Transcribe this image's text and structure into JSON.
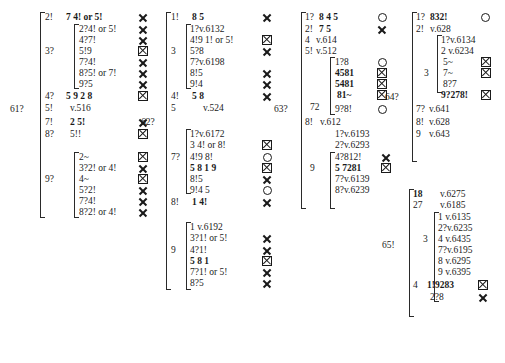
{
  "document": {
    "kind": "critical-apparatus-table",
    "page_width": 505,
    "page_height": 363,
    "background": "#ffffff",
    "ink": "#1a1a1a"
  },
  "symbols": {
    "cross": "X",
    "boxed_cross": "⌧",
    "circle": "O"
  },
  "columns": [
    {
      "id": "col1",
      "group_label": "61?",
      "entries": [
        {
          "key": "2!",
          "text": "7 4! or 5!",
          "sym": "cross"
        },
        {
          "key": "",
          "text": "2?4! or 5!",
          "sym": "cross",
          "sub": true
        },
        {
          "key": "",
          "text": "4?7!",
          "sym": "cross",
          "sub": true
        },
        {
          "key": "3?",
          "text": "5!9",
          "sym": "boxed_cross",
          "sub": true
        },
        {
          "key": "",
          "text": "7?4!",
          "sym": "cross",
          "sub": true
        },
        {
          "key": "",
          "text": "8?5! or 7!",
          "sym": "cross",
          "sub": true
        },
        {
          "key": "",
          "text": "9?5",
          "sym": "cross",
          "sub": true
        },
        {
          "key": "4?",
          "text": "5 9    2    8",
          "sym": "boxed_cross"
        },
        {
          "key": "5!",
          "text": "v.516",
          "sym": ""
        },
        {
          "key": "7!",
          "text": "2 5!",
          "sym": "cross"
        },
        {
          "key": "8?",
          "text": "5!!",
          "sym": "boxed_cross"
        },
        {
          "key": "",
          "text": "2~",
          "sym": "boxed_cross",
          "sub": true
        },
        {
          "key": "",
          "text": "3?2! or 4!",
          "sym": "cross",
          "sub": true
        },
        {
          "key": "9?",
          "text": "4~",
          "sym": "boxed_cross",
          "sub": true
        },
        {
          "key": "",
          "text": "5?2!",
          "sym": "cross",
          "sub": true
        },
        {
          "key": "",
          "text": "7?4!",
          "sym": "cross",
          "sub": true
        },
        {
          "key": "",
          "text": "8?2! or 4!",
          "sym": "cross",
          "sub": true
        }
      ]
    },
    {
      "id": "col2",
      "group_label": "62?",
      "entries": [
        {
          "key": "1!",
          "text": "8 5",
          "sym": "cross"
        },
        {
          "key": "",
          "text": "1?v.6132",
          "sym": "",
          "sub": true
        },
        {
          "key": "",
          "text": "4!9  1! or 5!",
          "sym": "boxed_cross",
          "sub": true
        },
        {
          "key": "3",
          "text": "5?8",
          "sym": "cross",
          "sub": true
        },
        {
          "key": "",
          "text": "7?v.6198",
          "sym": "",
          "sub": true
        },
        {
          "key": "",
          "text": "8!5",
          "sym": "cross",
          "sub": true
        },
        {
          "key": "",
          "text": "9!4",
          "sym": "cross",
          "sub": true
        },
        {
          "key": "4!",
          "text": "5 8",
          "sym": "cross"
        },
        {
          "key": "5",
          "text": "v.524",
          "sym": ""
        },
        {
          "key": "",
          "text": "1?v.6172",
          "sym": "",
          "sub": true
        },
        {
          "key": "",
          "text": "3 4! or 8!",
          "sym": "boxed_cross",
          "sub": true
        },
        {
          "key": "7?",
          "text": "4!9  8!",
          "sym": "circle",
          "sub": true
        },
        {
          "key": "",
          "text": "5  8   1   9",
          "sym": "boxed_cross",
          "sub": true
        },
        {
          "key": "",
          "text": "8!5",
          "sym": "cross",
          "sub": true
        },
        {
          "key": "",
          "text": "9!4 5",
          "sym": "circle",
          "sub": true
        },
        {
          "key": "8!",
          "text": "1 4!",
          "sym": "cross"
        },
        {
          "key": "",
          "text": "1  v.6192",
          "sym": "",
          "sub": true
        },
        {
          "key": "",
          "text": "3?1! or 5!",
          "sym": "cross",
          "sub": true
        },
        {
          "key": "9",
          "text": "4?1!",
          "sym": "cross",
          "sub": true
        },
        {
          "key": "",
          "text": "5  8  1",
          "sym": "boxed_cross",
          "sub": true
        },
        {
          "key": "",
          "text": "7?1! or 5!",
          "sym": "cross",
          "sub": true
        },
        {
          "key": "",
          "text": "8?5",
          "sym": "cross",
          "sub": true
        }
      ]
    },
    {
      "id": "col3",
      "group_label": "63?",
      "entries": [
        {
          "key": "1?",
          "text": "8  4  5",
          "sym": "circle"
        },
        {
          "key": "2!",
          "text": "7 5",
          "sym": "cross"
        },
        {
          "key": "4",
          "text": "v.614",
          "sym": ""
        },
        {
          "key": "5!",
          "text": "v.512",
          "sym": ""
        },
        {
          "key": "",
          "text": "1?8",
          "sym": "circle",
          "sub": true
        },
        {
          "key": "72",
          "text": "4581",
          "sym": "boxed_cross",
          "sub": true
        },
        {
          "key": "",
          "text": "5481",
          "sym": "boxed_cross",
          "sub": true
        },
        {
          "key": "",
          "text": "81~",
          "sym": "boxed_cross",
          "sub": true
        },
        {
          "key": "",
          "text": "9?8!",
          "sym": "circle",
          "sub": true
        },
        {
          "key": "8!",
          "text": "v.612",
          "sym": ""
        },
        {
          "key": "",
          "text": "1?v.6193",
          "sym": "",
          "sub": true
        },
        {
          "key": "",
          "text": "2?v.6293",
          "sym": "",
          "sub": true
        },
        {
          "key": "9",
          "text": "4?812!",
          "sym": "cross",
          "sub": true
        },
        {
          "key": "",
          "text": "5  7281",
          "sym": "boxed_cross",
          "sub": true
        },
        {
          "key": "",
          "text": "7?v.6139",
          "sym": "",
          "sub": true
        },
        {
          "key": "",
          "text": "8?v.6239",
          "sym": "",
          "sub": true
        }
      ]
    },
    {
      "id": "col4a",
      "group_label": "64?",
      "entries": [
        {
          "key": "1?",
          "text": "832!",
          "sym": "circle"
        },
        {
          "key": "2!",
          "text": "v.628",
          "sym": ""
        },
        {
          "key": "",
          "text": "1?v.6134",
          "sym": "",
          "sub": true
        },
        {
          "key": "",
          "text": "2  v.6234",
          "sym": "",
          "sub": true
        },
        {
          "key": "",
          "text": "5~",
          "sym": "boxed_cross",
          "sub": true
        },
        {
          "key": "3",
          "text": "7~",
          "sym": "boxed_cross",
          "sub": true
        },
        {
          "key": "",
          "text": "8?7",
          "sym": "",
          "sub": true
        },
        {
          "key": "",
          "text": "9?278!",
          "sym": "boxed_cross",
          "sub": true
        },
        {
          "key": "7?",
          "text": "v.641",
          "sym": ""
        },
        {
          "key": "8!",
          "text": "v.628",
          "sym": ""
        },
        {
          "key": "9",
          "text": "v.643",
          "sym": ""
        }
      ]
    },
    {
      "id": "col4b",
      "group_label": "65!",
      "entries": [
        {
          "key": "18",
          "text": "v.6275",
          "sym": ""
        },
        {
          "key": "27",
          "text": "v.6185",
          "sym": ""
        },
        {
          "key": "",
          "text": "1  v.6135",
          "sym": "",
          "sub": true
        },
        {
          "key": "",
          "text": "2?v.6235",
          "sym": "",
          "sub": true
        },
        {
          "key": "3",
          "text": "4  v.6435",
          "sym": "",
          "sub": true
        },
        {
          "key": "",
          "text": "7?v.6195",
          "sym": "",
          "sub": true
        },
        {
          "key": "",
          "text": "8  v.6295",
          "sym": "",
          "sub": true
        },
        {
          "key": "",
          "text": "9  v.6395",
          "sym": "",
          "sub": true
        },
        {
          "key": "4",
          "text": "1!9283",
          "sym": "boxed_cross"
        },
        {
          "key": "",
          "text": "2?8",
          "sym": "cross"
        }
      ]
    }
  ]
}
